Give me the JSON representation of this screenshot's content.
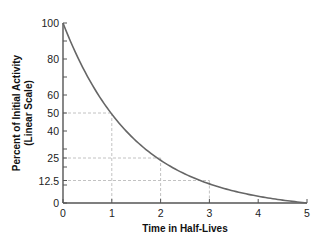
{
  "chart_data": {
    "type": "line",
    "title": "",
    "xlabel": "Time in Half-Lives",
    "ylabel_line1": "Percent of Initial Activity",
    "ylabel_line2": "(Linear Scale)",
    "xlim": [
      0,
      5
    ],
    "ylim": [
      0,
      100
    ],
    "x_ticks": [
      0,
      1,
      2,
      3,
      4,
      5
    ],
    "x_tick_labels": [
      "0",
      "1",
      "2",
      "3",
      "4",
      "5"
    ],
    "y_tick_labels": [
      {
        "value": 100,
        "label": "100"
      },
      {
        "value": 80,
        "label": "80"
      },
      {
        "value": 60,
        "label": "60"
      },
      {
        "value": 50,
        "label": "50"
      },
      {
        "value": 40,
        "label": "40"
      },
      {
        "value": 25,
        "label": "25"
      },
      {
        "value": 12.5,
        "label": "12.5"
      },
      {
        "value": 0,
        "label": "0"
      }
    ],
    "y_minor_ticks": [
      90,
      70,
      30,
      20,
      10
    ],
    "series": [
      {
        "name": "Activity",
        "x": [
          0,
          0.5,
          1,
          1.5,
          2,
          2.5,
          3,
          3.5,
          4,
          4.5,
          5
        ],
        "values": [
          100,
          70.7,
          50,
          35.4,
          25,
          17.7,
          12.5,
          8.8,
          6.25,
          3.1,
          0
        ]
      }
    ],
    "reference_lines": [
      {
        "x": 1,
        "y": 50
      },
      {
        "x": 2,
        "y": 25
      },
      {
        "x": 3,
        "y": 12.5
      }
    ],
    "grid": false,
    "legend": "none",
    "colors": {
      "curve": "#666666",
      "axis": "#555555",
      "guide": "#bbbbbb"
    }
  }
}
